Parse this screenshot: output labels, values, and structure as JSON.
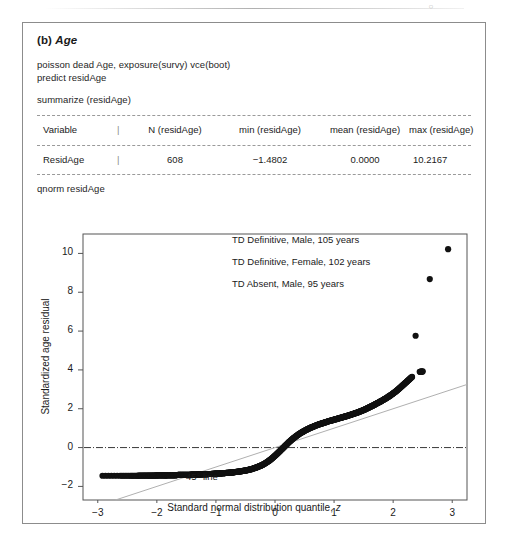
{
  "page": {
    "header_mark": "○"
  },
  "figure": {
    "label": "(b)",
    "title": "Age",
    "code_lines": [
      "poisson dead Age, exposure(survy) vce(boot)",
      "predict residAge",
      "summarize (residAge)",
      "qnorm residAge"
    ]
  },
  "summary_table": {
    "separator": "|",
    "headers": [
      "Variable",
      "N (residAge)",
      "min (residAge)",
      "mean (residAge)",
      "max (residAge)"
    ],
    "rows": [
      [
        "ResidAge",
        "608",
        "−1.4802",
        "0.0000",
        "10.2167"
      ]
    ]
  },
  "chart_data": {
    "type": "scatter",
    "title": "",
    "xlabel": "Standard normal distribution quantile, z",
    "ylabel": "Standardized age residual",
    "xlim": [
      -3.25,
      3.25
    ],
    "ylim": [
      -2.7,
      11.0
    ],
    "xticks": [
      -3,
      -2,
      -1,
      0,
      1,
      2,
      3
    ],
    "xtick_labels": [
      "−3",
      "−2",
      "−1",
      "0",
      "1",
      "2",
      "3"
    ],
    "yticks": [
      -2,
      0,
      2,
      4,
      6,
      8,
      10
    ],
    "ytick_labels": [
      "−2",
      "0",
      "2",
      "4",
      "6",
      "8",
      "10"
    ],
    "grid": false,
    "legend": "none",
    "reference_lines": [
      {
        "name": "zero-line",
        "type": "horizontal",
        "y": 0,
        "style": "dash-dot"
      },
      {
        "name": "45-degree-line",
        "type": "identity",
        "slope": 1,
        "intercept": 0,
        "style": "solid",
        "label": "45° line"
      }
    ],
    "annotations": [
      {
        "text": "TD Definitive, Male, 105 years",
        "point": [
          2.93,
          10.22
        ]
      },
      {
        "text": "TD Definitive, Female, 102 years",
        "point": [
          2.62,
          8.68
        ]
      },
      {
        "text": "TD Absent, Male, 95 years",
        "point": [
          2.38,
          5.76
        ]
      }
    ],
    "n_points": 608,
    "points": [
      [
        -2.92,
        -1.45
      ],
      [
        -2.62,
        -1.45
      ],
      [
        -2.45,
        -1.45
      ],
      [
        -2.33,
        -1.45
      ],
      [
        -2.24,
        -1.44
      ],
      [
        -2.16,
        -1.44
      ],
      [
        -2.09,
        -1.44
      ],
      [
        -2.03,
        -1.44
      ],
      [
        -1.98,
        -1.43
      ],
      [
        -1.93,
        -1.43
      ],
      [
        -1.88,
        -1.43
      ],
      [
        -1.84,
        -1.43
      ],
      [
        -1.8,
        -1.42
      ],
      [
        -1.76,
        -1.42
      ],
      [
        -1.72,
        -1.42
      ],
      [
        -1.68,
        -1.42
      ],
      [
        -1.64,
        -1.41
      ],
      [
        -1.6,
        -1.41
      ],
      [
        -1.56,
        -1.41
      ],
      [
        -1.52,
        -1.4
      ],
      [
        -1.48,
        -1.4
      ],
      [
        -1.44,
        -1.4
      ],
      [
        -1.4,
        -1.39
      ],
      [
        -1.36,
        -1.39
      ],
      [
        -1.32,
        -1.39
      ],
      [
        -1.28,
        -1.38
      ],
      [
        -1.24,
        -1.38
      ],
      [
        -1.2,
        -1.37
      ],
      [
        -1.16,
        -1.37
      ],
      [
        -1.12,
        -1.36
      ],
      [
        -1.08,
        -1.36
      ],
      [
        -1.04,
        -1.35
      ],
      [
        -1.0,
        -1.34
      ],
      [
        -0.96,
        -1.34
      ],
      [
        -0.92,
        -1.33
      ],
      [
        -0.88,
        -1.32
      ],
      [
        -0.84,
        -1.31
      ],
      [
        -0.8,
        -1.3
      ],
      [
        -0.76,
        -1.29
      ],
      [
        -0.72,
        -1.28
      ],
      [
        -0.68,
        -1.26
      ],
      [
        -0.64,
        -1.25
      ],
      [
        -0.6,
        -1.23
      ],
      [
        -0.56,
        -1.21
      ],
      [
        -0.52,
        -1.19
      ],
      [
        -0.48,
        -1.17
      ],
      [
        -0.44,
        -1.14
      ],
      [
        -0.4,
        -1.11
      ],
      [
        -0.36,
        -1.07
      ],
      [
        -0.32,
        -1.03
      ],
      [
        -0.28,
        -0.98
      ],
      [
        -0.24,
        -0.93
      ],
      [
        -0.2,
        -0.87
      ],
      [
        -0.16,
        -0.8
      ],
      [
        -0.12,
        -0.72
      ],
      [
        -0.08,
        -0.63
      ],
      [
        -0.04,
        -0.53
      ],
      [
        0.0,
        -0.42
      ],
      [
        0.04,
        -0.31
      ],
      [
        0.08,
        -0.19
      ],
      [
        0.12,
        -0.07
      ],
      [
        0.16,
        0.05
      ],
      [
        0.2,
        0.17
      ],
      [
        0.24,
        0.29
      ],
      [
        0.28,
        0.4
      ],
      [
        0.32,
        0.5
      ],
      [
        0.36,
        0.59
      ],
      [
        0.4,
        0.68
      ],
      [
        0.44,
        0.76
      ],
      [
        0.48,
        0.83
      ],
      [
        0.52,
        0.9
      ],
      [
        0.56,
        0.96
      ],
      [
        0.6,
        1.02
      ],
      [
        0.64,
        1.07
      ],
      [
        0.68,
        1.12
      ],
      [
        0.72,
        1.17
      ],
      [
        0.76,
        1.21
      ],
      [
        0.8,
        1.25
      ],
      [
        0.84,
        1.29
      ],
      [
        0.88,
        1.33
      ],
      [
        0.92,
        1.37
      ],
      [
        0.96,
        1.4
      ],
      [
        1.0,
        1.44
      ],
      [
        1.04,
        1.47
      ],
      [
        1.08,
        1.51
      ],
      [
        1.12,
        1.54
      ],
      [
        1.16,
        1.58
      ],
      [
        1.2,
        1.61
      ],
      [
        1.24,
        1.65
      ],
      [
        1.28,
        1.69
      ],
      [
        1.32,
        1.73
      ],
      [
        1.36,
        1.77
      ],
      [
        1.4,
        1.81
      ],
      [
        1.44,
        1.86
      ],
      [
        1.48,
        1.91
      ],
      [
        1.52,
        1.96
      ],
      [
        1.56,
        2.02
      ],
      [
        1.6,
        2.08
      ],
      [
        1.64,
        2.14
      ],
      [
        1.68,
        2.2
      ],
      [
        1.72,
        2.27
      ],
      [
        1.76,
        2.33
      ],
      [
        1.8,
        2.4
      ],
      [
        1.84,
        2.47
      ],
      [
        1.88,
        2.54
      ],
      [
        1.92,
        2.62
      ],
      [
        1.96,
        2.7
      ],
      [
        2.0,
        2.79
      ],
      [
        2.04,
        2.88
      ],
      [
        2.08,
        2.98
      ],
      [
        2.12,
        3.09
      ],
      [
        2.16,
        3.2
      ],
      [
        2.2,
        3.31
      ],
      [
        2.24,
        3.42
      ],
      [
        2.28,
        3.53
      ],
      [
        2.32,
        3.64
      ],
      [
        2.38,
        5.76
      ],
      [
        2.45,
        3.9
      ],
      [
        2.5,
        3.92
      ],
      [
        2.62,
        8.68
      ],
      [
        2.93,
        10.22
      ]
    ]
  }
}
